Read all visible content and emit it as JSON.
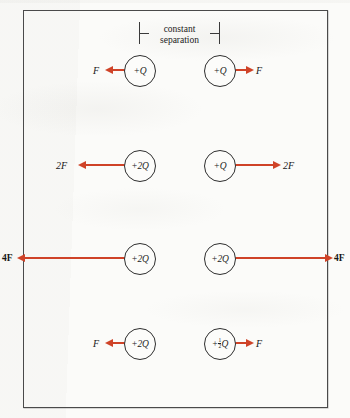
{
  "figure": {
    "background_color": "#fbfbf9",
    "border_color": "#4a4a4a",
    "arrow_color": "#cf4328",
    "circle_stroke_color": "#2e2e2e",
    "text_color": "#1b1b1b"
  },
  "annotation": {
    "bracket_label_line1": "constant",
    "bracket_label_line2": "separation"
  },
  "rows": [
    {
      "id": "row-1",
      "left_charge": "+Q",
      "right_charge": "+Q",
      "left_force": "F",
      "right_force": "F",
      "arrow_length_label": "short"
    },
    {
      "id": "row-2",
      "left_charge": "+2Q",
      "right_charge": "+Q",
      "left_force": "2F",
      "right_force": "2F",
      "arrow_length_label": "medium"
    },
    {
      "id": "row-3",
      "left_charge": "+2Q",
      "right_charge": "+2Q",
      "left_force": "4F",
      "right_force": "4F",
      "arrow_length_label": "long"
    },
    {
      "id": "row-4",
      "left_charge": "+2Q",
      "right_charge_prefix": "+",
      "right_charge_numerator": "1",
      "right_charge_denominator": "2",
      "right_charge_suffix": "Q",
      "right_charge": "+1/2 Q",
      "left_force": "F",
      "right_force": "F",
      "arrow_length_label": "short"
    }
  ]
}
